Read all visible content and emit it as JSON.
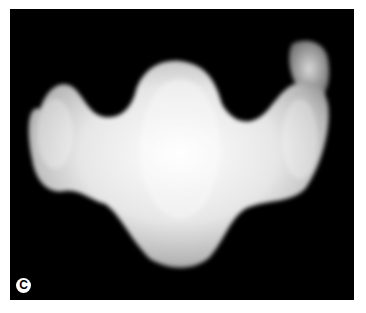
{
  "figure": {
    "panel_label": "C",
    "background_color": "#000000",
    "subject_color": "#f0f0f0"
  }
}
